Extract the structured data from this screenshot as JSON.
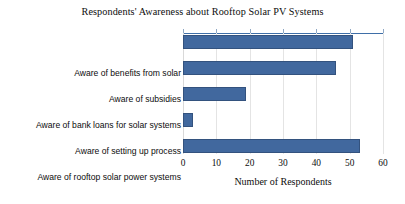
{
  "chart_data": {
    "type": "bar",
    "orientation": "horizontal",
    "title": "Respondents' Awareness about Rooftop Solar PV Systems",
    "xlabel": "Number of Respondents",
    "ylabel": "",
    "categories": [
      "Aware of benefits from solar",
      "Aware of subsidies",
      "Aware of bank loans for solar systems",
      "Aware of setting up process",
      "Aware of rooftop solar power systems"
    ],
    "values": [
      51,
      46,
      19,
      3,
      53
    ],
    "xlim": [
      0,
      60
    ],
    "xticks": [
      0,
      10,
      20,
      30,
      40,
      50,
      60
    ],
    "xtick_labels": [
      "0",
      "10",
      "20",
      "30",
      "40",
      "50",
      "60"
    ],
    "grid": "vertical",
    "legend": "none",
    "series": [
      {
        "name": "Number of Respondents",
        "values": [
          51,
          46,
          19,
          3,
          53
        ],
        "color": "#41689e"
      }
    ],
    "colors": {
      "bar_fill": "#41689e",
      "bar_border": "#33527e",
      "gridline": "#e4e4e4",
      "top_axis": "#3f6fa8",
      "background": "#ffffff",
      "text": "#0d0d0d"
    }
  }
}
